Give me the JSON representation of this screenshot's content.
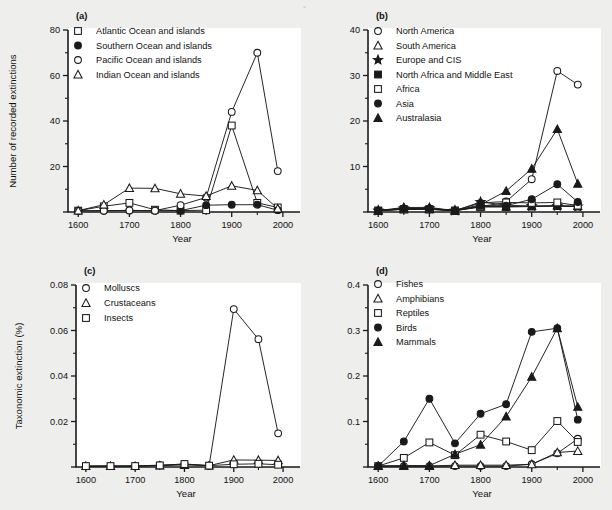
{
  "figure": {
    "background_color": "#eeeeec",
    "plot_background_color": "#ffffff",
    "ink_color": "#1a1a1a",
    "panels": [
      "(a)",
      "(b)",
      "(c)",
      "(d)"
    ]
  },
  "chart_data": [
    {
      "id": "a",
      "panel_label": "(a)",
      "type": "line",
      "title": "",
      "xlabel": "Year",
      "ylabel": "Number of recorded extinctions",
      "x": [
        1600,
        1650,
        1700,
        1750,
        1800,
        1850,
        1900,
        1950,
        1990
      ],
      "xlim": [
        1580,
        2010
      ],
      "ylim": [
        0,
        80
      ],
      "xticks": [
        1600,
        1700,
        1800,
        1900,
        2000
      ],
      "xticklabels": [
        "1600",
        "1700",
        "1800",
        "1900",
        "2000"
      ],
      "yticks": [
        0,
        20,
        40,
        60,
        80
      ],
      "yticklabels": [
        "",
        "20",
        "40",
        "60",
        "80"
      ],
      "grid": false,
      "legend_position": "upper-left",
      "series": [
        {
          "name": "Atlantic Ocean and islands",
          "marker": "open-square",
          "values": [
            0.6,
            2.5,
            4.0,
            1.0,
            0.6,
            0.8,
            38.0,
            4.0,
            2.0
          ]
        },
        {
          "name": "Southern Ocean and islands",
          "marker": "filled-circle",
          "values": [
            0.5,
            0.6,
            0.7,
            0.6,
            0.6,
            3.0,
            3.2,
            3.2,
            0.8
          ]
        },
        {
          "name": "Pacific Ocean and islands",
          "marker": "open-circle",
          "values": [
            0.5,
            0.6,
            0.7,
            0.6,
            3.0,
            6.4,
            44.0,
            70.0,
            18.0
          ]
        },
        {
          "name": "Indian Ocean and islands",
          "marker": "open-triangle",
          "values": [
            0.6,
            3.2,
            10.5,
            10.4,
            8.0,
            7.0,
            11.5,
            9.5,
            1.5
          ]
        }
      ]
    },
    {
      "id": "b",
      "panel_label": "(b)",
      "type": "line",
      "title": "",
      "xlabel": "Year",
      "ylabel": "",
      "x": [
        1600,
        1650,
        1700,
        1750,
        1800,
        1850,
        1900,
        1950,
        1990
      ],
      "xlim": [
        1580,
        2010
      ],
      "ylim": [
        0,
        40
      ],
      "xticks": [
        1600,
        1700,
        1800,
        1900,
        2000
      ],
      "xticklabels": [
        "1600",
        "1700",
        "1800",
        "1900",
        "2000"
      ],
      "yticks": [
        0,
        10,
        20,
        30,
        40
      ],
      "yticklabels": [
        "",
        "10",
        "20",
        "30",
        "40"
      ],
      "grid": false,
      "legend_position": "upper-left",
      "series": [
        {
          "name": "North America",
          "marker": "open-circle",
          "values": [
            0.3,
            0.8,
            0.8,
            0.3,
            2.0,
            2.3,
            7.2,
            31.0,
            28.0
          ]
        },
        {
          "name": "South America",
          "marker": "open-triangle",
          "values": [
            0.3,
            0.6,
            0.6,
            0.3,
            1.2,
            1.2,
            1.3,
            1.4,
            1.3
          ]
        },
        {
          "name": "Europe and CIS",
          "marker": "filled-star",
          "values": [
            0.3,
            0.8,
            0.8,
            0.3,
            2.2,
            1.5,
            1.3,
            1.3,
            1.2
          ]
        },
        {
          "name": "North Africa and Middle East",
          "marker": "filled-square",
          "values": [
            0.3,
            0.6,
            0.6,
            0.3,
            1.1,
            1.1,
            1.2,
            1.3,
            1.2
          ]
        },
        {
          "name": "Africa",
          "marker": "open-square",
          "values": [
            0.3,
            0.6,
            0.6,
            0.3,
            1.2,
            2.1,
            2.0,
            2.1,
            1.4
          ]
        },
        {
          "name": "Asia",
          "marker": "filled-circle",
          "values": [
            0.3,
            0.7,
            0.7,
            0.3,
            1.4,
            1.4,
            2.8,
            6.1,
            2.2
          ]
        },
        {
          "name": "Australasia",
          "marker": "filled-triangle",
          "values": [
            0.3,
            1.0,
            1.0,
            0.3,
            1.6,
            4.6,
            9.5,
            18.2,
            6.2
          ]
        }
      ]
    },
    {
      "id": "c",
      "panel_label": "(c)",
      "type": "line",
      "title": "",
      "xlabel": "Year",
      "ylabel": "Taxonomic extinction (%)",
      "x": [
        1600,
        1650,
        1700,
        1750,
        1800,
        1850,
        1900,
        1950,
        1990
      ],
      "xlim": [
        1580,
        2010
      ],
      "ylim": [
        0,
        0.08
      ],
      "xticks": [
        1600,
        1700,
        1800,
        1900,
        2000
      ],
      "xticklabels": [
        "1600",
        "1700",
        "1800",
        "1900",
        "2000"
      ],
      "yticks": [
        0,
        0.02,
        0.04,
        0.06,
        0.08
      ],
      "yticklabels": [
        "",
        "0.02",
        "0.04",
        "0.06",
        "0.08"
      ],
      "grid": false,
      "legend_position": "upper-left",
      "series": [
        {
          "name": "Molluscs",
          "marker": "open-circle",
          "values": [
            0.0004,
            0.0004,
            0.0005,
            0.0008,
            0.0013,
            0.0006,
            0.0694,
            0.0562,
            0.0148
          ]
        },
        {
          "name": "Crustaceans",
          "marker": "open-triangle",
          "values": [
            0.0004,
            0.0004,
            0.0004,
            0.0006,
            0.0009,
            0.0006,
            0.0031,
            0.003,
            0.0029
          ]
        },
        {
          "name": "Insects",
          "marker": "open-square",
          "values": [
            0.0004,
            0.0004,
            0.0004,
            0.0007,
            0.0013,
            0.0006,
            0.0012,
            0.0014,
            0.001
          ]
        }
      ]
    },
    {
      "id": "d",
      "panel_label": "(d)",
      "type": "line",
      "title": "",
      "xlabel": "Year",
      "ylabel": "",
      "x": [
        1600,
        1650,
        1700,
        1750,
        1800,
        1850,
        1900,
        1950,
        1990
      ],
      "xlim": [
        1580,
        2010
      ],
      "ylim": [
        0,
        0.4
      ],
      "xticks": [
        1600,
        1700,
        1800,
        1900,
        2000
      ],
      "xticklabels": [
        "1600",
        "1700",
        "1800",
        "1900",
        "2000"
      ],
      "yticks": [
        0,
        0.1,
        0.2,
        0.3,
        0.4
      ],
      "yticklabels": [
        "",
        "0.1",
        "0.2",
        "0.3",
        "0.4"
      ],
      "grid": false,
      "legend_position": "upper-left",
      "series": [
        {
          "name": "Fishes",
          "marker": "open-circle",
          "values": [
            0.002,
            0.002,
            0.002,
            0.002,
            0.002,
            0.002,
            0.006,
            0.03,
            0.062
          ]
        },
        {
          "name": "Amphibians",
          "marker": "open-triangle",
          "values": [
            0.002,
            0.002,
            0.002,
            0.004,
            0.004,
            0.004,
            0.006,
            0.032,
            0.035
          ]
        },
        {
          "name": "Reptiles",
          "marker": "open-square",
          "values": [
            0.002,
            0.02,
            0.054,
            0.026,
            0.071,
            0.056,
            0.037,
            0.101,
            0.055
          ]
        },
        {
          "name": "Birds",
          "marker": "filled-circle",
          "values": [
            0.002,
            0.056,
            0.15,
            0.052,
            0.117,
            0.138,
            0.297,
            0.305,
            0.104
          ]
        },
        {
          "name": "Mammals",
          "marker": "filled-triangle",
          "values": [
            0.002,
            0.003,
            0.003,
            0.028,
            0.049,
            0.111,
            0.198,
            0.305,
            0.132
          ]
        }
      ]
    }
  ]
}
